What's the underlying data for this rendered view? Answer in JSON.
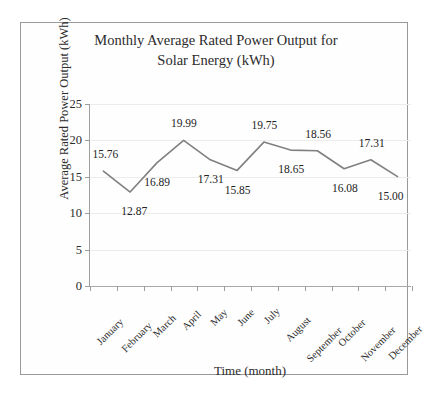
{
  "chart_data": {
    "type": "line",
    "title": "Monthly Average Rated Power Output for Solar Energy (kWh)",
    "title_lines": [
      "Monthly Average Rated Power Output for",
      "Solar Energy (kWh)"
    ],
    "xlabel": "Time (month)",
    "ylabel": "Average Rated Power Output (kWh)",
    "categories": [
      "January",
      "February",
      "March",
      "April",
      "May",
      "June",
      "July",
      "August",
      "September",
      "October",
      "November",
      "December"
    ],
    "values": [
      15.76,
      12.87,
      16.89,
      19.99,
      17.31,
      15.85,
      19.75,
      18.65,
      18.56,
      16.08,
      17.31,
      15.0
    ],
    "data_labels": [
      "15.76",
      "12.87",
      "16.89",
      "19.99",
      "17.31",
      "15.85",
      "19.75",
      "18.65",
      "18.56",
      "16.08",
      "17.31",
      "15.00"
    ],
    "label_positions": [
      "above",
      "below",
      "below",
      "above",
      "below",
      "below",
      "above",
      "below",
      "above",
      "below",
      "above",
      "below"
    ],
    "ylim": [
      0,
      25
    ],
    "yticks": [
      0,
      5,
      10,
      15,
      20,
      25
    ],
    "ytick_labels": [
      "0",
      "5",
      "10",
      "15",
      "20",
      "25"
    ],
    "grid": true,
    "legend": false,
    "series_color": "#808080",
    "grid_color": "#ececec",
    "axis_color": "#9e9e9e",
    "text_color": "#2b2b2b"
  }
}
